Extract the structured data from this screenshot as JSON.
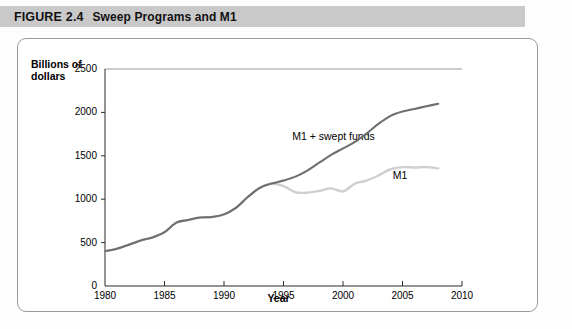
{
  "header": {
    "figure_word": "FIGURE",
    "figure_number": "2.4",
    "title": "Sweep Programs and M1",
    "band_color": "#c9c9c9"
  },
  "chart_data": {
    "type": "line",
    "title": "Sweep Programs and M1",
    "xlabel": "Year",
    "ylabel": "Billions of dollars",
    "xlim": [
      1980,
      2010
    ],
    "ylim": [
      0,
      2500
    ],
    "xticks": [
      "1980",
      "1985",
      "1990",
      "1995",
      "2000",
      "2005",
      "2010"
    ],
    "yticks": [
      "0",
      "500",
      "1000",
      "1500",
      "2000",
      "2500"
    ],
    "grid": false,
    "legend_position": "inline-annotation",
    "x": [
      1980,
      1981,
      1982,
      1983,
      1984,
      1985,
      1986,
      1987,
      1988,
      1989,
      1990,
      1991,
      1992,
      1993,
      1994,
      1995,
      1996,
      1997,
      1998,
      1999,
      2000,
      2001,
      2002,
      2003,
      2004,
      2005,
      2006,
      2007,
      2008
    ],
    "series": [
      {
        "name": "M1",
        "color": "#cfcfcf",
        "label": "M1",
        "values": [
          400,
          430,
          475,
          525,
          560,
          620,
          730,
          760,
          790,
          795,
          825,
          900,
          1025,
          1130,
          1180,
          1150,
          1080,
          1075,
          1095,
          1125,
          1090,
          1180,
          1215,
          1275,
          1345,
          1370,
          1365,
          1370,
          1355
        ]
      },
      {
        "name": "M1 + swept funds",
        "color": "#6e6e6e",
        "label": "M1 + swept funds",
        "values": [
          400,
          430,
          475,
          525,
          560,
          620,
          730,
          760,
          790,
          795,
          825,
          900,
          1025,
          1130,
          1180,
          1215,
          1260,
          1330,
          1420,
          1510,
          1585,
          1660,
          1760,
          1870,
          1960,
          2010,
          2040,
          2070,
          2100
        ]
      }
    ],
    "annotations": [
      {
        "text": "M1 + swept funds",
        "x": 1999.2,
        "y": 1720
      },
      {
        "text": "M1",
        "x": 2004.8,
        "y": 1270
      }
    ]
  },
  "caption": ""
}
